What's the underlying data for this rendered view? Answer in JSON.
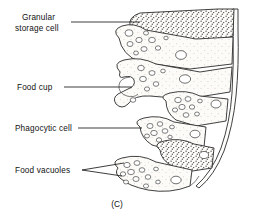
{
  "figure": {
    "caption": "(C)",
    "ink_color": "#1a1a1a",
    "cell_fill_color": "#fbfaf7",
    "background_color": "#ffffff"
  },
  "labels": [
    {
      "id": "granular-storage-cell",
      "line1": "Granular",
      "line2": "storage cell",
      "leader": "single"
    },
    {
      "id": "food-cup",
      "line1": "Food cup",
      "line2": "",
      "leader": "single"
    },
    {
      "id": "phagocytic-cell",
      "line1": "Phagocytic cell",
      "line2": "",
      "leader": "single"
    },
    {
      "id": "food-vacuoles",
      "line1": "Food vacuoles",
      "line2": "",
      "leader": "forked"
    }
  ],
  "structures": {
    "granular_storage_cells": 2,
    "phagocytic_cells": 4,
    "food_cups": 1,
    "nuclei_visible": 6
  }
}
